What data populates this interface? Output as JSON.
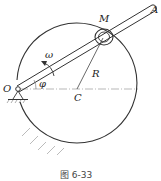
{
  "figure": {
    "caption": "图  6-33",
    "labels": {
      "O": "O",
      "A": "A",
      "M": "M",
      "C": "C",
      "R": "R",
      "omega": "ω",
      "phi": "φ"
    }
  }
}
